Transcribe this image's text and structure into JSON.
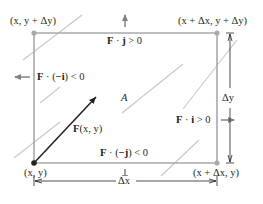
{
  "diagram": {
    "colors": {
      "boundary": "#a7a9ac",
      "field_lines": "#c7c8ca",
      "vector": "#231f20",
      "text": "#231f20",
      "normal_arrows": "#808285",
      "dimension": "#231f20"
    },
    "corners": {
      "top_left": "(x, y + Δy)",
      "top_right": "(x + Δx, y + Δy)",
      "bottom_left": "(x, y)",
      "bottom_right": "(x + Δx, y)"
    },
    "edge_labels": {
      "top": {
        "vec": "F",
        "dot": " · ",
        "normal": "j",
        "rel": " > 0"
      },
      "left": {
        "vec": "F",
        "dot": " · (",
        "normal": "−i",
        "rel": ") < 0"
      },
      "right": {
        "vec": "F",
        "dot": " · ",
        "normal": "i",
        "rel": " > 0"
      },
      "bottom": {
        "vec": "F",
        "dot": " · (",
        "normal": "−j",
        "rel": ") < 0"
      }
    },
    "region_label": "A",
    "vector_label": {
      "vec": "F",
      "args": "(x, y)"
    },
    "dimensions": {
      "width": "Δx",
      "height": "Δy"
    }
  }
}
